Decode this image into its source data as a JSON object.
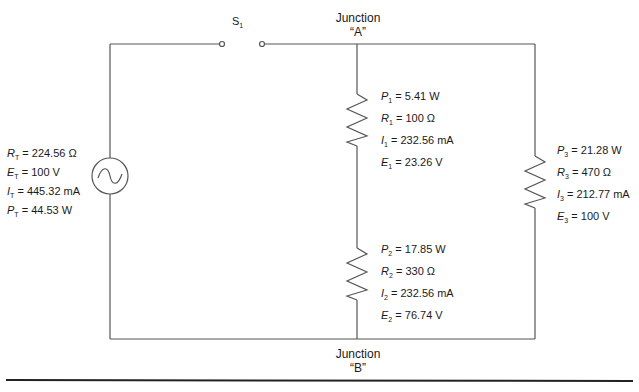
{
  "colors": {
    "wire": "#555555",
    "text": "#1a1a1a",
    "rule": "#222222"
  },
  "switch": {
    "symbol": "S",
    "sub": "1"
  },
  "junction_a": {
    "line1": "Junction",
    "line2": "“A”"
  },
  "junction_b": {
    "line1": "Junction",
    "line2": "“B”"
  },
  "source": {
    "icon": "ac-source-icon",
    "rows": [
      {
        "sym": "R",
        "sub": "T",
        "value": " = 224.56 Ω"
      },
      {
        "sym": "E",
        "sub": "T",
        "value": " = 100 V"
      },
      {
        "sym": "I",
        "sub": "T",
        "value": " = 445.32 mA"
      },
      {
        "sym": "P",
        "sub": "T",
        "value": " = 44.53 W"
      }
    ]
  },
  "r1": {
    "rows": [
      {
        "sym": "P",
        "sub": "1",
        "value": " = 5.41 W"
      },
      {
        "sym": "R",
        "sub": "1",
        "value": " = 100 Ω"
      },
      {
        "sym": "I",
        "sub": "1",
        "value": " = 232.56 mA"
      },
      {
        "sym": "E",
        "sub": "1",
        "value": " = 23.26 V"
      }
    ]
  },
  "r2": {
    "rows": [
      {
        "sym": "P",
        "sub": "2",
        "value": " = 17.85 W"
      },
      {
        "sym": "R",
        "sub": "2",
        "value": " = 330 Ω"
      },
      {
        "sym": "I",
        "sub": "2",
        "value": " = 232.56 mA"
      },
      {
        "sym": "E",
        "sub": "2",
        "value": " = 76.74 V"
      }
    ]
  },
  "r3": {
    "rows": [
      {
        "sym": "P",
        "sub": "3",
        "value": " = 21.28 W"
      },
      {
        "sym": "R",
        "sub": "3",
        "value": " = 470 Ω"
      },
      {
        "sym": "I",
        "sub": "3",
        "value": " = 212.77 mA"
      },
      {
        "sym": "E",
        "sub": "3",
        "value": " = 100 V"
      }
    ]
  }
}
